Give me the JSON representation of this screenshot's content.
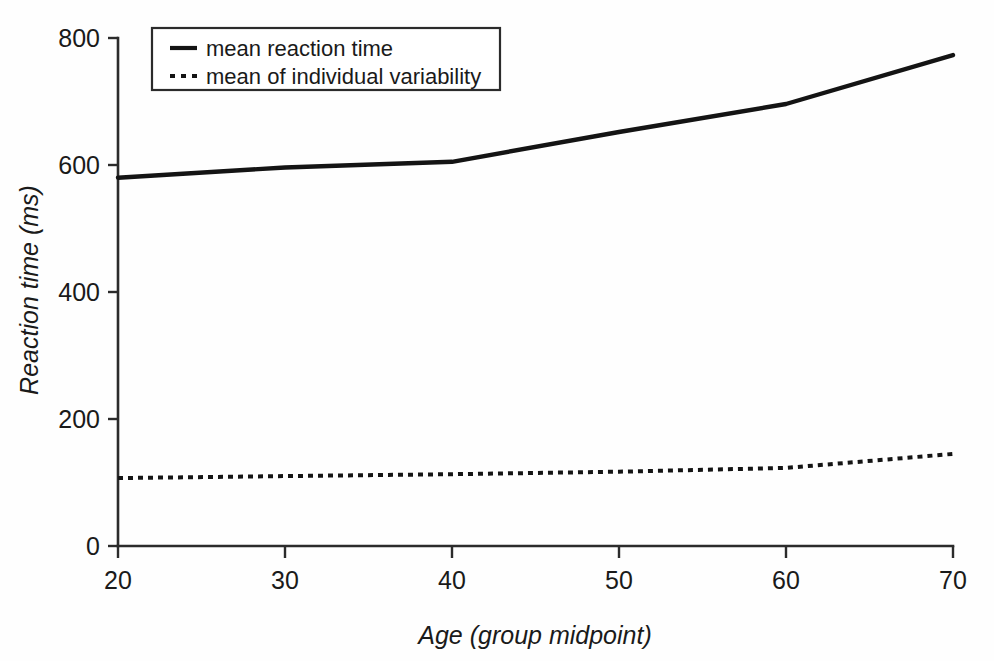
{
  "chart_data": {
    "type": "line",
    "title": "",
    "xlabel": "Age (group midpoint)",
    "ylabel": "Reaction time (ms)",
    "x": [
      20,
      30,
      40,
      50,
      60,
      70
    ],
    "xtick_labels": [
      "20",
      "30",
      "40",
      "50",
      "60",
      "70"
    ],
    "ytick_labels": [
      "0",
      "200",
      "400",
      "600",
      "800"
    ],
    "yticks": [
      0,
      200,
      400,
      600,
      800
    ],
    "xlim": [
      20,
      70
    ],
    "ylim": [
      0,
      800
    ],
    "grid": false,
    "legend_position": "top-left-inside",
    "series": [
      {
        "name": "mean reaction time",
        "style": "solid",
        "values": [
          580,
          596,
          605,
          652,
          696,
          773
        ]
      },
      {
        "name": "mean of individual variability",
        "style": "dotted",
        "values": [
          107,
          110,
          113,
          117,
          123,
          145
        ]
      }
    ]
  },
  "axes": {
    "y_title": "Reaction time (ms)",
    "x_title": "Age (group midpoint)",
    "y_ticks": [
      {
        "label": "800",
        "value": 800
      },
      {
        "label": "600",
        "value": 600
      },
      {
        "label": "400",
        "value": 400
      },
      {
        "label": "200",
        "value": 200
      },
      {
        "label": "0",
        "value": 0
      }
    ],
    "x_ticks": [
      {
        "label": "20",
        "value": 20
      },
      {
        "label": "30",
        "value": 30
      },
      {
        "label": "40",
        "value": 40
      },
      {
        "label": "50",
        "value": 50
      },
      {
        "label": "60",
        "value": 60
      },
      {
        "label": "70",
        "value": 70
      }
    ]
  },
  "legend": {
    "entries": [
      {
        "label": "mean reaction time",
        "style": "solid"
      },
      {
        "label": "mean of individual variability",
        "style": "dotted"
      }
    ]
  },
  "colors": {
    "background": "#fefefe",
    "ink": "#141414",
    "axis": "#2b2b2b"
  }
}
